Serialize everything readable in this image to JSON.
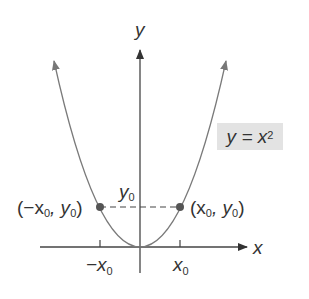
{
  "diagram": {
    "axes": {
      "x_label": "x",
      "y_label": "y"
    },
    "curve": {
      "equation_label": "y = x",
      "equation_exponent": "2",
      "color": "#7a7a7a"
    },
    "points": [
      {
        "label_prefix": "(−x",
        "label_sub1": "0",
        "label_mid": ", y",
        "label_sub2": "0",
        "label_suffix": ")"
      },
      {
        "label_prefix": "(x",
        "label_sub1": "0",
        "label_mid": ", y",
        "label_sub2": "0",
        "label_suffix": ")"
      }
    ],
    "ticks": {
      "neg_x0_main": "−x",
      "neg_x0_sub": "0",
      "x0_main": "x",
      "x0_sub": "0",
      "y0_main": "y",
      "y0_sub": "0"
    },
    "colors": {
      "axis": "#444444",
      "curve": "#7a7a7a",
      "point": "#555555",
      "label_box": "#e3e3e3",
      "text": "#333333"
    }
  }
}
